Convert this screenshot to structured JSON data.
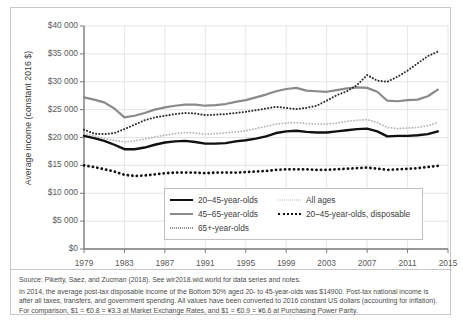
{
  "chart_data": {
    "type": "line",
    "title": "",
    "xlabel": "",
    "ylabel": "Average income (constant 2016 $)",
    "xlim": [
      1979,
      2015
    ],
    "ylim": [
      0,
      40000
    ],
    "grid": true,
    "legend_position": "inside-bottom-center",
    "ytick_labels": [
      "$40 000",
      "$35 000",
      "$30 000",
      "$25 000",
      "$20 000",
      "$15 000",
      "$10 000",
      "$5 000",
      "$0"
    ],
    "ytick_values": [
      40000,
      35000,
      30000,
      25000,
      20000,
      15000,
      10000,
      5000,
      0
    ],
    "xtick_labels": [
      "1979",
      "1983",
      "1987",
      "1991",
      "1995",
      "1999",
      "2003",
      "2007",
      "2011",
      "2015"
    ],
    "xtick_values": [
      1979,
      1983,
      1987,
      1991,
      1995,
      1999,
      2003,
      2007,
      2011,
      2015
    ],
    "x": [
      1979,
      1980,
      1981,
      1982,
      1983,
      1984,
      1985,
      1986,
      1987,
      1988,
      1989,
      1990,
      1991,
      1992,
      1993,
      1994,
      1995,
      1996,
      1997,
      1998,
      1999,
      2000,
      2001,
      2002,
      2003,
      2004,
      2005,
      2006,
      2007,
      2008,
      2009,
      2010,
      2011,
      2012,
      2013,
      2014
    ],
    "series": [
      {
        "name": "20–45-year-olds",
        "style": "solid",
        "color": "#111111",
        "width": 2.4,
        "values": [
          20300,
          19900,
          19400,
          18700,
          17900,
          17900,
          18200,
          18700,
          19100,
          19300,
          19400,
          19200,
          18900,
          18900,
          19000,
          19300,
          19500,
          19800,
          20200,
          20800,
          21100,
          21200,
          21000,
          20900,
          20900,
          21100,
          21300,
          21500,
          21600,
          21100,
          20200,
          20300,
          20300,
          20400,
          20600,
          21100
        ]
      },
      {
        "name": "45–65-year-olds",
        "style": "solid",
        "color": "#8a8a8a",
        "width": 2.2,
        "values": [
          27200,
          26800,
          26300,
          25200,
          23600,
          23900,
          24400,
          25000,
          25400,
          25700,
          25900,
          25900,
          25700,
          25800,
          26000,
          26400,
          26700,
          27200,
          27700,
          28300,
          28700,
          28900,
          28400,
          28300,
          28200,
          28500,
          28800,
          29000,
          28900,
          28200,
          26600,
          26500,
          26700,
          26800,
          27400,
          28600
        ]
      },
      {
        "name": "65+-year-olds",
        "style": "dotted-fine",
        "color": "#2b2b2b",
        "width": 2.0,
        "values": [
          21400,
          20700,
          20600,
          20800,
          21500,
          22300,
          23100,
          23600,
          23900,
          24200,
          24400,
          24300,
          24000,
          24100,
          24200,
          24400,
          24600,
          24900,
          25200,
          25500,
          25300,
          25100,
          25300,
          25700,
          26600,
          27600,
          28300,
          29400,
          31200,
          30200,
          30000,
          30900,
          32000,
          33300,
          34600,
          35400
        ]
      },
      {
        "name": "All ages",
        "style": "dotted-light",
        "color": "#b4b4b4",
        "width": 1.8,
        "values": [
          20700,
          20300,
          19800,
          19500,
          19200,
          19400,
          19700,
          20100,
          20400,
          20700,
          20900,
          20800,
          20600,
          20700,
          20800,
          21000,
          21200,
          21600,
          22000,
          22400,
          22600,
          22700,
          22500,
          22400,
          22400,
          22600,
          22900,
          23100,
          23200,
          22700,
          21800,
          21600,
          21700,
          21800,
          22100,
          22700
        ]
      },
      {
        "name": "20–45-year-olds, disposable",
        "style": "dotted-bold",
        "color": "#111111",
        "width": 2.8,
        "values": [
          15000,
          14700,
          14300,
          13900,
          13300,
          13100,
          13200,
          13400,
          13600,
          13700,
          13700,
          13700,
          13600,
          13700,
          13700,
          13700,
          13800,
          13900,
          14000,
          14200,
          14300,
          14300,
          14300,
          14200,
          14200,
          14300,
          14400,
          14500,
          14600,
          14400,
          14200,
          14300,
          14400,
          14500,
          14700,
          14900
        ]
      }
    ]
  },
  "legend": {
    "entries": [
      {
        "label": "20–45-year-olds",
        "marker": "solid-black-line-icon"
      },
      {
        "label": "45–65-year-olds",
        "marker": "solid-gray-line-icon"
      },
      {
        "label": "65+-year-olds",
        "marker": "fine-dotted-line-icon"
      },
      {
        "label": "All ages",
        "marker": "light-dotted-line-icon"
      },
      {
        "label": "20–45-year-olds, disposable",
        "marker": "bold-dotted-line-icon"
      }
    ]
  },
  "notes": {
    "source": "Source: Piketty, Saez, and Zucman (2018). See wir2018.wid.world for data series and notes.",
    "body": "In 2014, the average post-tax disposable income of the Bottom 50% aged 20- to 45-year-olds was $14900. Post-tax national income is after all taxes, transfers, and government spending. All values have been converted to 2016 constant US dollars (accounting for inflation). For comparison, $1 = €0.8 = ¥3.3 at Market Exchange Rates, and $1 = €0.9 = ¥6.6 at Purchasing Power Parity."
  }
}
